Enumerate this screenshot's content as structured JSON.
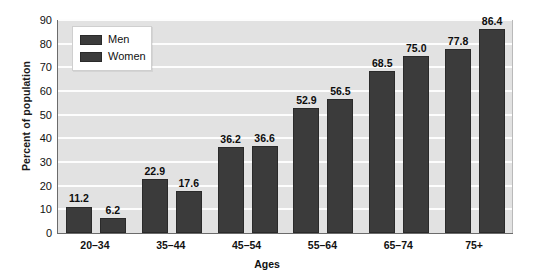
{
  "chart_data": {
    "type": "bar",
    "title": "",
    "subtitle": "",
    "xlabel": "Ages",
    "ylabel": "Percent of population",
    "ylim": [
      0,
      90
    ],
    "yticks": [
      0,
      10,
      20,
      30,
      40,
      50,
      60,
      70,
      80,
      90
    ],
    "grid": true,
    "legend_position": "top-left",
    "categories": [
      "20–34",
      "35–44",
      "45–54",
      "55–64",
      "65–74",
      "75+"
    ],
    "series": [
      {
        "name": "Men",
        "color": "#3b3b3b",
        "values": [
          11.2,
          22.9,
          36.2,
          52.9,
          68.5,
          77.8
        ],
        "labels": [
          "11.2",
          "22.9",
          "36.2",
          "52.9",
          "68.5",
          "77.8"
        ]
      },
      {
        "name": "Women",
        "color": "#3b3b3b",
        "values": [
          6.2,
          17.6,
          36.6,
          56.5,
          75.0,
          86.4
        ],
        "labels": [
          "6.2",
          "17.6",
          "36.6",
          "56.5",
          "75.0",
          "86.4"
        ]
      }
    ],
    "ytick_labels": [
      "0",
      "10",
      "20",
      "30",
      "40",
      "50",
      "60",
      "70",
      "80",
      "90"
    ],
    "colors": {
      "plot_background": "#e2e2e2",
      "gridline": "#fdfdfd",
      "bar": "#3b3b3b",
      "bar_border": "#2a2a2a",
      "axis": "#6b6b6b",
      "text": "#111111",
      "page_background": "#ffffff",
      "legend_background": "#ffffff",
      "legend_border": "#cfcfcf"
    }
  },
  "legend": {
    "items": [
      {
        "label": "Men"
      },
      {
        "label": "Women"
      }
    ]
  },
  "axes": {
    "y_title": "Percent of population",
    "x_title": "Ages"
  }
}
